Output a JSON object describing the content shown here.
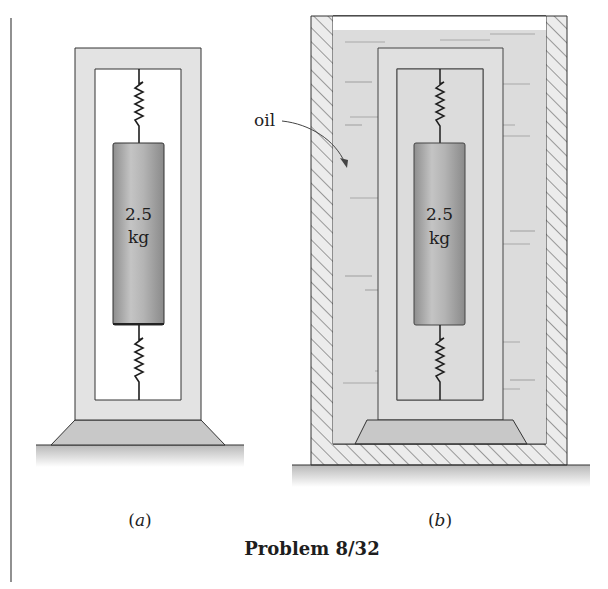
{
  "figure": {
    "caption": "Problem 8/32",
    "panels": [
      {
        "id": "a",
        "label_open": "(",
        "label_letter": "a",
        "label_close": ")",
        "mass_value": "2.5",
        "mass_unit": "kg",
        "medium": "air"
      },
      {
        "id": "b",
        "label_open": "(",
        "label_letter": "b",
        "label_close": ")",
        "mass_value": "2.5",
        "mass_unit": "kg",
        "medium": "oil",
        "medium_label": "oil"
      }
    ]
  },
  "colors": {
    "frame_fill": "#e3e3e3",
    "mass_fill": "#a9a9a9",
    "oil_fill": "#dcdcdc",
    "base_fill": "#c8c8c8",
    "line": "#2a2a2a"
  }
}
